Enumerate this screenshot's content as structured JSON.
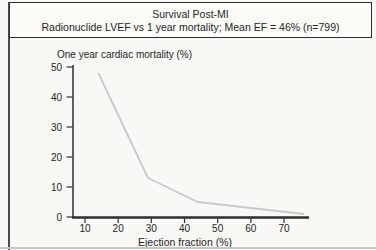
{
  "header": {
    "title": "Survival Post-MI",
    "subtitle": "Radionuclide LVEF vs 1 year mortality; Mean EF = 46% (n=799)"
  },
  "chart_data": {
    "type": "line",
    "title": "Survival Post-MI",
    "subtitle": "Radionuclide LVEF vs 1 year mortality; Mean EF = 46% (n=799)",
    "xlabel": "Ejection fraction (%)",
    "ylabel": "One year cardiac mortality (%)",
    "xlim": [
      5,
      77
    ],
    "ylim": [
      0,
      50
    ],
    "x_ticks": [
      10,
      20,
      30,
      40,
      50,
      60,
      70
    ],
    "y_ticks": [
      0,
      10,
      20,
      30,
      40,
      50
    ],
    "series": [
      {
        "x": [
          14,
          29,
          44,
          76
        ],
        "y": [
          48,
          13,
          5,
          1
        ]
      }
    ],
    "grid": false,
    "legend": "none",
    "line_color": "#c9c9c9",
    "axis_color": "#2e2e2e"
  }
}
